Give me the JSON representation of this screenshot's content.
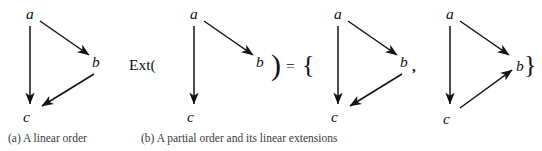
{
  "figure": {
    "background_color": "#ffffff",
    "ink_color": "#121212",
    "panels": [
      {
        "id": "a",
        "caption": "(a) A linear order",
        "diagrams": [
          {
            "id": "linear-order",
            "nodes": [
              {
                "label": "a",
                "x": 22,
                "y": 8
              },
              {
                "label": "b",
                "x": 88,
                "y": 56
              },
              {
                "label": "c",
                "x": 20,
                "y": 108
              }
            ],
            "edges": [
              {
                "from": "a",
                "to": "c"
              },
              {
                "from": "a",
                "to": "b"
              },
              {
                "from": "b",
                "to": "c"
              }
            ]
          }
        ]
      },
      {
        "id": "b",
        "caption": "(b) A partial order and its linear extensions",
        "operators": {
          "ext_open": "Ext(",
          "paren_close": ")",
          "equals": "=",
          "brace_open": "{",
          "comma": ",",
          "brace_close": "}"
        },
        "diagrams": [
          {
            "id": "partial-order",
            "nodes": [
              {
                "label": "a",
                "x": 22,
                "y": 8
              },
              {
                "label": "b",
                "x": 88,
                "y": 56
              },
              {
                "label": "c",
                "x": 20,
                "y": 108
              }
            ],
            "edges": [
              {
                "from": "a",
                "to": "c"
              },
              {
                "from": "a",
                "to": "b"
              }
            ]
          },
          {
            "id": "linear-extension-1",
            "nodes": [
              {
                "label": "a",
                "x": 22,
                "y": 8
              },
              {
                "label": "b",
                "x": 88,
                "y": 56
              },
              {
                "label": "c",
                "x": 20,
                "y": 108
              }
            ],
            "edges": [
              {
                "from": "a",
                "to": "c"
              },
              {
                "from": "a",
                "to": "b"
              },
              {
                "from": "b",
                "to": "c"
              }
            ]
          },
          {
            "id": "linear-extension-2",
            "nodes": [
              {
                "label": "a",
                "x": 22,
                "y": 8
              },
              {
                "label": "b",
                "x": 88,
                "y": 56
              },
              {
                "label": "c",
                "x": 20,
                "y": 108
              }
            ],
            "edges": [
              {
                "from": "a",
                "to": "c"
              },
              {
                "from": "a",
                "to": "b"
              },
              {
                "from": "c",
                "to": "b"
              }
            ]
          }
        ]
      }
    ]
  },
  "labels": {
    "node_a": "a",
    "node_b": "b",
    "node_c": "c"
  }
}
